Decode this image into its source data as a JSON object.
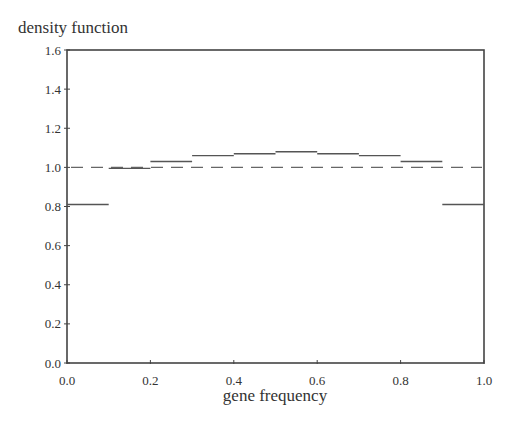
{
  "chart_data": {
    "type": "line",
    "subtype": "step",
    "title": "",
    "xlabel": "gene frequency",
    "ylabel": "density function",
    "xlim": [
      0.0,
      1.0
    ],
    "ylim": [
      0.0,
      1.6
    ],
    "x_ticks": [
      "0.0",
      "0.2",
      "0.4",
      "0.6",
      "0.8",
      "1.0"
    ],
    "y_ticks": [
      "0.0",
      "0.2",
      "0.4",
      "0.6",
      "0.8",
      "1.0",
      "1.2",
      "1.4",
      "1.6"
    ],
    "grid": false,
    "legend": null,
    "series": [
      {
        "name": "histogram density",
        "style": "solid step",
        "bins": [
          {
            "x0": 0.0,
            "x1": 0.1,
            "y": 0.81
          },
          {
            "x0": 0.1,
            "x1": 0.2,
            "y": 0.995
          },
          {
            "x0": 0.2,
            "x1": 0.3,
            "y": 1.03
          },
          {
            "x0": 0.3,
            "x1": 0.4,
            "y": 1.06
          },
          {
            "x0": 0.4,
            "x1": 0.5,
            "y": 1.07
          },
          {
            "x0": 0.5,
            "x1": 0.6,
            "y": 1.08
          },
          {
            "x0": 0.6,
            "x1": 0.7,
            "y": 1.07
          },
          {
            "x0": 0.7,
            "x1": 0.8,
            "y": 1.06
          },
          {
            "x0": 0.8,
            "x1": 0.9,
            "y": 1.03
          },
          {
            "x0": 0.9,
            "x1": 1.0,
            "y": 0.995
          }
        ]
      },
      {
        "name": "uniform reference",
        "style": "dashed",
        "x": [
          0.0,
          1.0
        ],
        "y": [
          1.0,
          1.0
        ]
      }
    ],
    "last_bin_note": "rightmost bin drawn at 0.81 from 0.9 to 1.0 as well",
    "extra_bins": [
      {
        "x0": 0.9,
        "x1": 1.0,
        "y": 0.81
      }
    ]
  },
  "colors": {
    "axis": "#444444",
    "line": "#555555",
    "dashed": "#666666",
    "text": "#333333"
  }
}
